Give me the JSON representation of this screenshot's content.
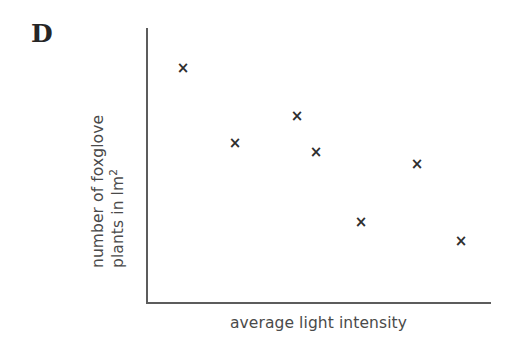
{
  "panel": {
    "label": "D"
  },
  "axes": {
    "x_title": "average light intensity",
    "y_title_line1": "number of foxglove",
    "y_title_line2_pre": "plants in lm",
    "y_title_line2_sup": "2"
  },
  "marker_glyph": "×",
  "colors": {
    "background": "#ffffff",
    "axis": "#5c5c5c",
    "marker": "#2e2e2e",
    "label_text": "#4a4a4a",
    "panel_label": "#262626"
  },
  "chart_data": {
    "type": "scatter",
    "title": "D",
    "xlabel": "average light intensity",
    "ylabel": "number of foxglove plants in lm2",
    "xlim": [
      0,
      1
    ],
    "ylim": [
      0,
      1
    ],
    "grid": false,
    "legend": null,
    "tick_labels": {
      "x": [],
      "y": []
    },
    "series": [
      {
        "name": "foxglove plants",
        "marker": "x",
        "points": [
          {
            "px": 183,
            "py": 68,
            "x": 0.107,
            "y": 0.854
          },
          {
            "px": 235,
            "py": 143,
            "x": 0.258,
            "y": 0.58
          },
          {
            "px": 297,
            "py": 116,
            "x": 0.438,
            "y": 0.679
          },
          {
            "px": 316,
            "py": 152,
            "x": 0.493,
            "y": 0.547
          },
          {
            "px": 361,
            "py": 222,
            "x": 0.623,
            "y": 0.292
          },
          {
            "px": 417,
            "py": 164,
            "x": 0.786,
            "y": 0.504
          },
          {
            "px": 461,
            "py": 241,
            "x": 0.913,
            "y": 0.223
          }
        ]
      }
    ]
  }
}
